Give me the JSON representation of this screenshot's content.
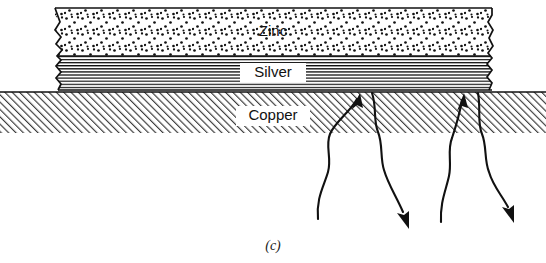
{
  "figure": {
    "caption": "(c)",
    "type": "materials-cross-section-diagram"
  },
  "layers": [
    {
      "id": "zinc",
      "label": "Zinc",
      "pattern": "stipple-dots",
      "label_x": 273,
      "label_y": 32,
      "label_has_white_box": false
    },
    {
      "id": "silver",
      "label": "Silver",
      "pattern": "horizontal-lines",
      "label_x": 273,
      "label_y": 73,
      "label_has_white_box": true
    },
    {
      "id": "copper",
      "label": "Copper",
      "pattern": "diagonal-hatch-45",
      "label_x": 273,
      "label_y": 116,
      "label_has_white_box": true
    }
  ],
  "arrows": [
    {
      "id": "arrow-up-left",
      "direction": "up",
      "tip_x": 360,
      "tip_y": 93,
      "tail_x": 318,
      "tail_y": 219
    },
    {
      "id": "arrow-down-left",
      "direction": "down",
      "tip_x": 409,
      "tip_y": 229,
      "tail_x": 372,
      "tail_y": 93
    },
    {
      "id": "arrow-up-right",
      "direction": "up",
      "tip_x": 464,
      "tip_y": 93,
      "tail_x": 441,
      "tail_y": 222
    },
    {
      "id": "arrow-down-right",
      "direction": "down",
      "tip_x": 514,
      "tip_y": 223,
      "tail_x": 478,
      "tail_y": 93
    }
  ],
  "colors": {
    "ink": "#111111",
    "background": "#ffffff",
    "hatch": "#3a3a3a"
  }
}
